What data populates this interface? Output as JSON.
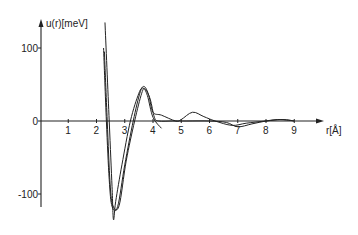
{
  "chart_data": {
    "type": "line",
    "title": "",
    "xlabel": "r[Å]",
    "ylabel": "u(r)[meV]",
    "xlim": [
      0,
      9.8
    ],
    "ylim": [
      -125,
      135
    ],
    "grid": false,
    "legend": null,
    "x_ticks": [
      1,
      2,
      3,
      4,
      5,
      6,
      7,
      8,
      9
    ],
    "x_tick_labels": [
      "1",
      "2",
      "3",
      "4",
      "5",
      "6",
      "7",
      "8",
      "9"
    ],
    "y_ticks": [
      100,
      0,
      -100
    ],
    "y_tick_labels": [
      "100",
      "0",
      "-100"
    ],
    "series": [
      {
        "name": "curve-deep",
        "points": [
          [
            2.3,
            135
          ],
          [
            2.45,
            0
          ],
          [
            2.55,
            -90
          ],
          [
            2.6,
            -135
          ],
          [
            2.68,
            -110
          ],
          [
            2.9,
            -60
          ],
          [
            3.2,
            0
          ],
          [
            3.5,
            38
          ],
          [
            3.65,
            45
          ],
          [
            3.8,
            35
          ],
          [
            4.0,
            5
          ],
          [
            4.3,
            -10
          ]
        ]
      },
      {
        "name": "curve-shallow-a",
        "points": [
          [
            2.25,
            100
          ],
          [
            2.35,
            0
          ],
          [
            2.45,
            -80
          ],
          [
            2.55,
            -117
          ],
          [
            2.75,
            -117
          ],
          [
            3.0,
            -60
          ],
          [
            3.3,
            0
          ],
          [
            3.55,
            40
          ],
          [
            3.7,
            47
          ],
          [
            3.85,
            35
          ],
          [
            4.0,
            12
          ],
          [
            4.3,
            8
          ],
          [
            4.8,
            0
          ],
          [
            5.0,
            2
          ],
          [
            5.4,
            12
          ],
          [
            5.8,
            6
          ],
          [
            6.2,
            0
          ],
          [
            6.8,
            -6
          ],
          [
            7.3,
            -3
          ],
          [
            8.0,
            0
          ],
          [
            8.6,
            2
          ],
          [
            9.0,
            0
          ]
        ]
      },
      {
        "name": "curve-shallow-b",
        "points": [
          [
            2.28,
            95
          ],
          [
            2.38,
            0
          ],
          [
            2.48,
            -85
          ],
          [
            2.58,
            -116
          ],
          [
            2.8,
            -116
          ],
          [
            3.05,
            -55
          ],
          [
            3.35,
            0
          ],
          [
            3.6,
            38
          ],
          [
            3.72,
            44
          ],
          [
            3.9,
            30
          ],
          [
            4.05,
            5
          ],
          [
            4.2,
            0
          ],
          [
            4.7,
            0
          ],
          [
            5.2,
            0
          ],
          [
            6.0,
            0
          ],
          [
            6.6,
            -2
          ],
          [
            7.0,
            -8
          ],
          [
            7.5,
            -4
          ],
          [
            8.0,
            0
          ],
          [
            8.4,
            2
          ],
          [
            8.8,
            1
          ],
          [
            9.0,
            0
          ]
        ]
      }
    ]
  },
  "axes": {
    "x_label": "r[Å]",
    "y_label": "u(r)[meV]"
  }
}
